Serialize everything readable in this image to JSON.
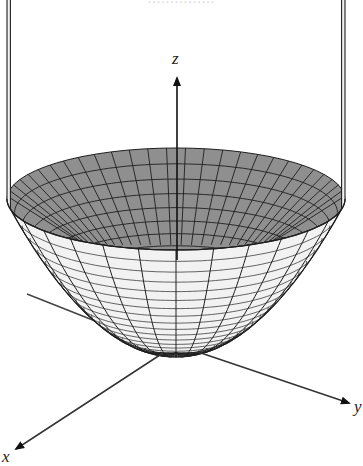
{
  "figure": {
    "title_clipped": "...............",
    "surface": "paraboloid z = x^2 + y^2",
    "colors": {
      "inside": "#8f8f8f",
      "outside": "#f2f2f2",
      "mesh": "#1e1e1e",
      "axis": "#333333"
    }
  },
  "axes": {
    "x": {
      "label": "x"
    },
    "y": {
      "label": "y"
    },
    "z": {
      "label": "z"
    }
  },
  "geometry": {
    "cx": 176,
    "rim_cy": 199,
    "rx": 169,
    "ry": 51,
    "vertex_y": 353,
    "radial_lines": 28,
    "rings_inside": 9,
    "rings_outside": 22
  }
}
